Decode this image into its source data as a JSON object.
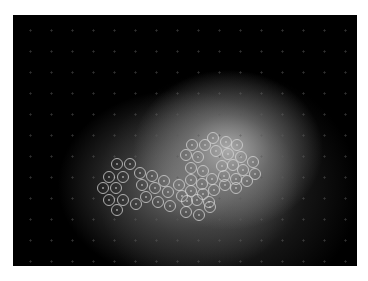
{
  "figure": {
    "type": "fluorescence-micrograph",
    "background_color": "#000000",
    "glow_color": "#b0b0b0",
    "marker_color": "#d8d8d8",
    "marker_radius": 5.5,
    "panel": {
      "x": 13,
      "y": 15,
      "width": 344,
      "height": 251
    },
    "markers": [
      [
        117,
        164
      ],
      [
        130,
        164
      ],
      [
        109,
        177
      ],
      [
        123,
        177
      ],
      [
        103,
        188
      ],
      [
        116,
        188
      ],
      [
        109,
        200
      ],
      [
        123,
        200
      ],
      [
        117,
        210
      ],
      [
        136,
        204
      ],
      [
        140,
        173
      ],
      [
        152,
        176
      ],
      [
        142,
        185
      ],
      [
        155,
        188
      ],
      [
        164,
        181
      ],
      [
        146,
        197
      ],
      [
        158,
        202
      ],
      [
        170,
        206
      ],
      [
        168,
        192
      ],
      [
        179,
        185
      ],
      [
        182,
        196
      ],
      [
        192,
        145
      ],
      [
        205,
        145
      ],
      [
        213,
        138
      ],
      [
        226,
        142
      ],
      [
        237,
        145
      ],
      [
        186,
        155
      ],
      [
        198,
        157
      ],
      [
        216,
        151
      ],
      [
        228,
        154
      ],
      [
        241,
        157
      ],
      [
        253,
        162
      ],
      [
        191,
        168
      ],
      [
        203,
        171
      ],
      [
        222,
        166
      ],
      [
        233,
        165
      ],
      [
        243,
        170
      ],
      [
        255,
        174
      ],
      [
        191,
        180
      ],
      [
        202,
        184
      ],
      [
        212,
        179
      ],
      [
        224,
        176
      ],
      [
        236,
        179
      ],
      [
        247,
        181
      ],
      [
        191,
        191
      ],
      [
        203,
        194
      ],
      [
        214,
        190
      ],
      [
        225,
        185
      ],
      [
        236,
        188
      ],
      [
        187,
        201
      ],
      [
        197,
        200
      ],
      [
        209,
        202
      ],
      [
        186,
        212
      ],
      [
        199,
        215
      ],
      [
        210,
        207
      ]
    ]
  }
}
